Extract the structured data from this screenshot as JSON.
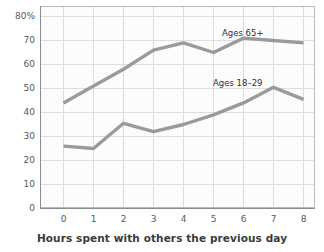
{
  "chart_data": {
    "type": "line",
    "title": "",
    "subtitle": "",
    "xlabel": "Hours spent with others the previous day",
    "ylabel": "",
    "x": [
      0,
      1,
      2,
      3,
      4,
      5,
      6,
      7,
      8
    ],
    "xtick_labels": [
      "0",
      "1",
      "2",
      "3",
      "4",
      "5",
      "6",
      "7",
      "8"
    ],
    "ytick_values": [
      0,
      10,
      20,
      30,
      40,
      50,
      60,
      70,
      80
    ],
    "ytick_labels": [
      "0",
      "10",
      "20",
      "30",
      "40",
      "50",
      "60",
      "70",
      "80%"
    ],
    "xlim": [
      -0.55,
      8.55
    ],
    "ylim": [
      0,
      84
    ],
    "grid": true,
    "legend_position": "inline-annotations",
    "series": [
      {
        "name": "Ages 65+",
        "color": "#9a9a9a",
        "values": [
          44,
          51,
          58,
          66,
          69,
          65,
          71,
          70,
          69
        ]
      },
      {
        "name": "Ages 18–29",
        "color": "#9a9a9a",
        "values": [
          26,
          25,
          35.5,
          32,
          35,
          39,
          44,
          50.5,
          45.5
        ]
      }
    ],
    "annotations": [
      {
        "text": "Ages 65+",
        "series": "Ages 65+"
      },
      {
        "text": "Ages 18–29",
        "series": "Ages 18–29"
      }
    ]
  },
  "axis": {
    "y_labels": [
      "80%",
      "70",
      "60",
      "50",
      "40",
      "30",
      "20",
      "10",
      "0"
    ],
    "x_labels": [
      "0",
      "1",
      "2",
      "3",
      "4",
      "5",
      "6",
      "7",
      "8"
    ],
    "x_title": "Hours spent with others the previous day"
  },
  "colors": {
    "line": "#9a9a9a",
    "grid": "#d9dadb",
    "axis": "#8b8c8e",
    "tick_text": "#58595b",
    "title_text": "#3b3b3d",
    "plot_background": "#fcfcfc",
    "page_background": "#ffffff"
  }
}
